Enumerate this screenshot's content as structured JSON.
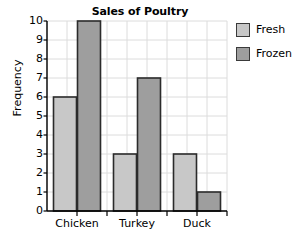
{
  "chart_data": {
    "type": "bar",
    "title": "Sales of Poultry",
    "xlabel": "",
    "ylabel": "Frequency",
    "categories": [
      "Chicken",
      "Turkey",
      "Duck"
    ],
    "series": [
      {
        "name": "Fresh",
        "values": [
          6,
          3,
          3
        ],
        "color": "#c8c8c8"
      },
      {
        "name": "Frozen",
        "values": [
          10,
          7,
          1
        ],
        "color": "#9e9e9e"
      }
    ],
    "ylim": [
      0,
      10
    ],
    "y_ticks": [
      "0",
      "1",
      "2",
      "3",
      "4",
      "5",
      "6",
      "7",
      "8",
      "9",
      "10"
    ],
    "grid": true,
    "legend_position": "right",
    "bar_border_color": "#2b2b2b",
    "axis_color": "#000000",
    "grid_color": "#dcdcdc"
  },
  "legend": {
    "items": [
      {
        "label": "Fresh"
      },
      {
        "label": "Frozen"
      }
    ]
  }
}
